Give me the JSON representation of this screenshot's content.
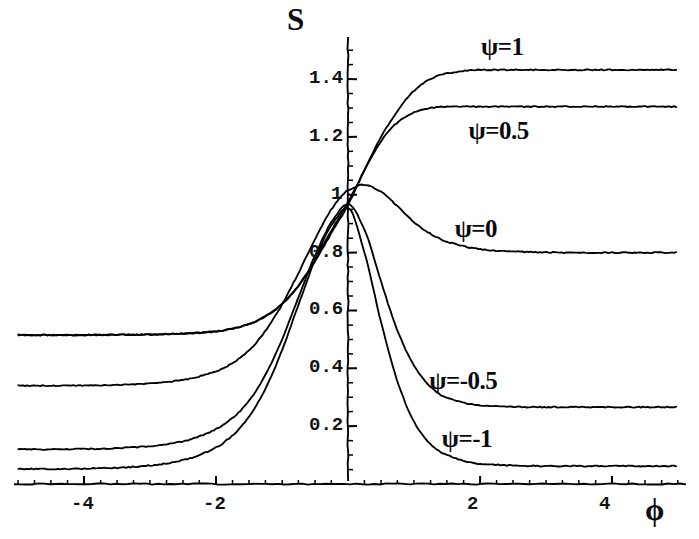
{
  "figure": {
    "width": 699,
    "height": 539,
    "background": "#ffffff",
    "ink_color": "#000000"
  },
  "axes": {
    "y_axis_title": "S",
    "x_axis_title": "ϕ",
    "x_tick_labels": [
      "-4",
      "-2",
      "2",
      "4"
    ],
    "y_tick_labels": [
      "1.4",
      "1.2",
      "1",
      "0.8",
      "0.6",
      "0.4",
      "0.2"
    ]
  },
  "curve_labels": [
    {
      "name": "psi-1",
      "text": "ψ=1"
    },
    {
      "name": "psi-0p5",
      "text": "ψ=0.5"
    },
    {
      "name": "psi-0",
      "text": "ψ=0"
    },
    {
      "name": "psi-m0p5",
      "text": "ψ=-0.5"
    },
    {
      "name": "psi-m1",
      "text": "ψ=-1"
    }
  ],
  "chart_data": {
    "type": "line",
    "title": "",
    "subtitle": "",
    "xlabel": "ϕ",
    "ylabel": "S",
    "xlim": [
      -5.0,
      5.0
    ],
    "ylim": [
      0.0,
      1.52
    ],
    "xticks": [
      -4,
      -2,
      2,
      4
    ],
    "yticks": [
      0.2,
      0.4,
      0.6,
      0.8,
      1.0,
      1.2,
      1.4
    ],
    "xtick_labels": [
      "-4",
      "-2",
      "2",
      "4"
    ],
    "ytick_labels": [
      "0.2",
      "0.4",
      "0.6",
      "0.8",
      "1",
      "1.2",
      "1.4"
    ],
    "minor_ticks": true,
    "grid": false,
    "legend": "inline-annotations",
    "legend_position": "inside-right",
    "axis_style": "crossed-at-origin",
    "annotations": [
      {
        "text": "ψ=1",
        "x": 2.3,
        "y": 1.5
      },
      {
        "text": "ψ=0.5",
        "x": 2.3,
        "y": 1.21
      },
      {
        "text": "ψ=0",
        "x": 1.9,
        "y": 0.87
      },
      {
        "text": "ψ=-0.5",
        "x": 1.8,
        "y": 0.345
      },
      {
        "text": "ψ=-1",
        "x": 1.8,
        "y": 0.145
      }
    ],
    "x": [
      -5.0,
      -4.5,
      -4.0,
      -3.5,
      -3.0,
      -2.5,
      -2.0,
      -1.75,
      -1.5,
      -1.25,
      -1.0,
      -0.75,
      -0.5,
      -0.25,
      0.0,
      0.25,
      0.5,
      0.75,
      1.0,
      1.25,
      1.5,
      2.0,
      2.5,
      3.0,
      3.5,
      4.0,
      4.5,
      5.0
    ],
    "series": [
      {
        "name": "ψ=1",
        "left_asymptote": 0.515,
        "right_asymptote": 1.432,
        "values": [
          0.515,
          0.515,
          0.515,
          0.516,
          0.517,
          0.52,
          0.528,
          0.537,
          0.553,
          0.58,
          0.622,
          0.686,
          0.77,
          0.868,
          0.965,
          1.085,
          1.2,
          1.29,
          1.36,
          1.4,
          1.42,
          1.432,
          1.432,
          1.432,
          1.432,
          1.432,
          1.432,
          1.432
        ]
      },
      {
        "name": "ψ=0.5",
        "left_asymptote": 0.515,
        "right_asymptote": 1.305,
        "values": [
          0.515,
          0.515,
          0.515,
          0.516,
          0.517,
          0.52,
          0.528,
          0.537,
          0.553,
          0.58,
          0.622,
          0.686,
          0.775,
          0.878,
          0.975,
          1.085,
          1.185,
          1.25,
          1.285,
          1.3,
          1.305,
          1.305,
          1.305,
          1.305,
          1.305,
          1.305,
          1.305,
          1.305
        ]
      },
      {
        "name": "ψ=0",
        "left_asymptote": 0.34,
        "right_asymptote": 0.8,
        "values": [
          0.34,
          0.34,
          0.341,
          0.343,
          0.348,
          0.36,
          0.39,
          0.418,
          0.462,
          0.53,
          0.62,
          0.73,
          0.845,
          0.95,
          1.015,
          1.035,
          1.01,
          0.96,
          0.905,
          0.865,
          0.838,
          0.812,
          0.804,
          0.801,
          0.8,
          0.8,
          0.8,
          0.8
        ]
      },
      {
        "name": "ψ=-0.5",
        "left_asymptote": 0.12,
        "right_asymptote": 0.266,
        "values": [
          0.12,
          0.12,
          0.121,
          0.124,
          0.131,
          0.148,
          0.19,
          0.228,
          0.288,
          0.378,
          0.5,
          0.645,
          0.79,
          0.905,
          0.968,
          0.88,
          0.7,
          0.53,
          0.41,
          0.335,
          0.298,
          0.272,
          0.267,
          0.266,
          0.266,
          0.266,
          0.266,
          0.266
        ]
      },
      {
        "name": "ψ=-1",
        "left_asymptote": 0.052,
        "right_asymptote": 0.062,
        "values": [
          0.052,
          0.052,
          0.053,
          0.056,
          0.064,
          0.082,
          0.126,
          0.168,
          0.233,
          0.33,
          0.462,
          0.62,
          0.775,
          0.895,
          0.955,
          0.8,
          0.56,
          0.355,
          0.215,
          0.138,
          0.1,
          0.07,
          0.064,
          0.062,
          0.062,
          0.062,
          0.062,
          0.062
        ]
      }
    ]
  },
  "geometry": {
    "x_origin_px": 348,
    "y_origin_px": 484,
    "px_per_x_unit": 66,
    "px_per_y_unit": 289.2,
    "x_axis_left_px": 14,
    "x_axis_right_px": 688,
    "y_axis_top_px": 37
  }
}
